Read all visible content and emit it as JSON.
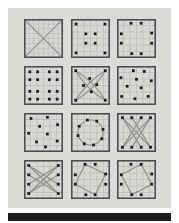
{
  "figure": {
    "colors": {
      "page_bg": "#ffffff",
      "plate_bg": "#dcdcd7",
      "panel_fill": "#d7d7d3",
      "panel_border": "#4c4c4a",
      "grid_line": "#b9b9b5",
      "dot": "#191919",
      "connector": "#8e8e8a",
      "bottom_bar": "#1c1c1c"
    },
    "grid_cells_default": 6,
    "chart_data": {
      "type": "table",
      "title": "",
      "rows": 4,
      "cols": 3,
      "description_fields": [
        "dots are [x,y] in 0-100 panel coords",
        "lines are [x1,y1,x2,y2]",
        "paths are svg path strings"
      ]
    },
    "panels": [
      {
        "id": "panel-1-grid-x",
        "grid_cells": 8,
        "dots": [],
        "lines": [
          [
            4,
            4,
            96,
            96
          ],
          [
            96,
            4,
            4,
            96
          ]
        ],
        "paths": [],
        "circle": null
      },
      {
        "id": "panel-2-corners-inner-square",
        "dots": [
          [
            13,
            13
          ],
          [
            87,
            13
          ],
          [
            13,
            87
          ],
          [
            87,
            87
          ],
          [
            38,
            38
          ],
          [
            62,
            38
          ],
          [
            38,
            62
          ],
          [
            62,
            62
          ]
        ],
        "lines": [],
        "paths": [],
        "circle": null
      },
      {
        "id": "panel-3-dot-ring",
        "dots": [
          [
            36,
            11
          ],
          [
            62,
            11
          ],
          [
            89,
            36
          ],
          [
            89,
            62
          ],
          [
            62,
            89
          ],
          [
            38,
            89
          ],
          [
            11,
            38
          ],
          [
            11,
            62
          ]
        ],
        "lines": [],
        "paths": [],
        "circle": null
      },
      {
        "id": "panel-4-four-clusters",
        "dots": [
          [
            15,
            15
          ],
          [
            35,
            15
          ],
          [
            65,
            15
          ],
          [
            85,
            15
          ],
          [
            15,
            35
          ],
          [
            35,
            35
          ],
          [
            65,
            35
          ],
          [
            85,
            35
          ],
          [
            15,
            65
          ],
          [
            35,
            65
          ],
          [
            65,
            65
          ],
          [
            85,
            65
          ],
          [
            15,
            85
          ],
          [
            35,
            85
          ],
          [
            65,
            85
          ],
          [
            85,
            85
          ]
        ],
        "lines": [],
        "paths": [],
        "circle": null
      },
      {
        "id": "panel-5-curved-x-star",
        "dots": [
          [
            12,
            12
          ],
          [
            88,
            12
          ],
          [
            12,
            88
          ],
          [
            88,
            88
          ],
          [
            48,
            32
          ],
          [
            32,
            50
          ],
          [
            66,
            48
          ],
          [
            52,
            66
          ]
        ],
        "lines": [],
        "paths": [
          "M12,12 Q60,40 88,88",
          "M12,12 Q40,60 88,88",
          "M88,12 Q60,60 12,88",
          "M88,12 Q40,40 12,88"
        ],
        "circle": null
      },
      {
        "id": "panel-6-scatter-a",
        "dots": [
          [
            42,
            12
          ],
          [
            70,
            14
          ],
          [
            10,
            30
          ],
          [
            50,
            34
          ],
          [
            88,
            38
          ],
          [
            26,
            52
          ],
          [
            62,
            56
          ],
          [
            12,
            78
          ],
          [
            46,
            84
          ],
          [
            80,
            78
          ]
        ],
        "lines": [],
        "paths": [],
        "circle": null
      },
      {
        "id": "panel-7-scatter-b",
        "dots": [
          [
            18,
            14
          ],
          [
            60,
            11
          ],
          [
            40,
            34
          ],
          [
            86,
            30
          ],
          [
            12,
            52
          ],
          [
            60,
            54
          ],
          [
            32,
            74
          ],
          [
            85,
            72
          ],
          [
            55,
            87
          ]
        ],
        "lines": [],
        "paths": [],
        "circle": null
      },
      {
        "id": "panel-8-circle-ring",
        "dots": [
          [
            82,
            42
          ],
          [
            66,
            21
          ],
          [
            42,
            18
          ],
          [
            21,
            34
          ],
          [
            18,
            58
          ],
          [
            34,
            79
          ],
          [
            58,
            82
          ],
          [
            79,
            66
          ]
        ],
        "lines": [],
        "paths": [],
        "circle": {
          "cx": 50,
          "cy": 50,
          "r": 32
        }
      },
      {
        "id": "panel-9-top-bottom-cross",
        "dots": [
          [
            14,
            12
          ],
          [
            38,
            12
          ],
          [
            62,
            12
          ],
          [
            86,
            12
          ],
          [
            14,
            88
          ],
          [
            38,
            88
          ],
          [
            62,
            88
          ],
          [
            86,
            88
          ]
        ],
        "lines": [
          [
            14,
            12,
            62,
            88
          ],
          [
            62,
            12,
            14,
            88
          ],
          [
            38,
            12,
            86,
            88
          ],
          [
            86,
            12,
            38,
            88
          ],
          [
            14,
            12,
            86,
            88
          ],
          [
            86,
            12,
            14,
            88
          ]
        ],
        "paths": [],
        "circle": null
      },
      {
        "id": "panel-10-left-right-cross",
        "dots": [
          [
            12,
            14
          ],
          [
            12,
            38
          ],
          [
            12,
            62
          ],
          [
            12,
            86
          ],
          [
            88,
            14
          ],
          [
            88,
            38
          ],
          [
            88,
            62
          ],
          [
            88,
            86
          ]
        ],
        "lines": [
          [
            12,
            14,
            88,
            62
          ],
          [
            12,
            62,
            88,
            14
          ],
          [
            12,
            38,
            88,
            86
          ],
          [
            12,
            86,
            88,
            38
          ],
          [
            12,
            14,
            88,
            86
          ],
          [
            12,
            86,
            88,
            14
          ]
        ],
        "paths": [],
        "circle": null
      },
      {
        "id": "panel-11-tilted-quad-a",
        "dots": [
          [
            36,
            11
          ],
          [
            62,
            11
          ],
          [
            89,
            36
          ],
          [
            89,
            62
          ],
          [
            62,
            89
          ],
          [
            38,
            89
          ],
          [
            11,
            38
          ],
          [
            11,
            62
          ]
        ],
        "lines": [],
        "paths": [
          "M36,11 L89,36 L62,89 L11,62 Z"
        ],
        "circle": null
      },
      {
        "id": "panel-12-tilted-quad-b",
        "dots": [
          [
            36,
            11
          ],
          [
            62,
            11
          ],
          [
            89,
            36
          ],
          [
            89,
            62
          ],
          [
            62,
            89
          ],
          [
            38,
            89
          ],
          [
            11,
            38
          ],
          [
            11,
            62
          ]
        ],
        "lines": [],
        "paths": [
          "M62,11 L89,62 L38,89 L11,38 Z"
        ],
        "circle": null
      }
    ]
  }
}
